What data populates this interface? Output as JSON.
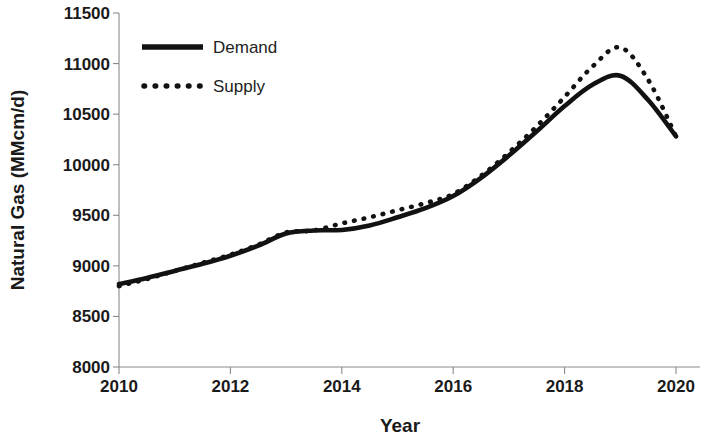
{
  "chart_data": {
    "type": "line",
    "title": "",
    "xlabel": "Year",
    "ylabel": "Natural Gas (MMcm/d)",
    "xlim": [
      2010,
      2020
    ],
    "ylim": [
      8000,
      11500
    ],
    "xticks": [
      2010,
      2012,
      2014,
      2016,
      2018,
      2020
    ],
    "xtick_labels": [
      "2010",
      "2012",
      "2014",
      "2016",
      "2018",
      "2020"
    ],
    "yticks": [
      8000,
      8500,
      9000,
      9500,
      10000,
      10500,
      11000,
      11500
    ],
    "ytick_labels": [
      "8000",
      "8500",
      "9000",
      "9500",
      "10000",
      "10500",
      "11000",
      "11500"
    ],
    "grid": false,
    "legend_position": "upper-left-inside",
    "x": [
      2010,
      2010.5,
      2011,
      2011.5,
      2012,
      2012.5,
      2013,
      2013.5,
      2014,
      2014.5,
      2015,
      2015.5,
      2016,
      2016.5,
      2017,
      2017.5,
      2018,
      2018.5,
      2019,
      2019.5,
      2020
    ],
    "series": [
      {
        "name": "Demand",
        "style": "solid",
        "color": "#121212",
        "values": [
          8820,
          8880,
          8950,
          9020,
          9100,
          9200,
          9320,
          9350,
          9355,
          9400,
          9480,
          9570,
          9690,
          9870,
          10090,
          10330,
          10580,
          10790,
          10880,
          10640,
          10280
        ]
      },
      {
        "name": "Supply",
        "style": "dotted",
        "color": "#121212",
        "values": [
          8800,
          8870,
          8950,
          9030,
          9110,
          9210,
          9330,
          9350,
          9420,
          9480,
          9550,
          9620,
          9710,
          9890,
          10120,
          10380,
          10670,
          10970,
          11160,
          10840,
          10280
        ]
      }
    ]
  },
  "legend": {
    "items": [
      {
        "label": "Demand",
        "style": "solid"
      },
      {
        "label": "Supply",
        "style": "dotted"
      }
    ]
  }
}
